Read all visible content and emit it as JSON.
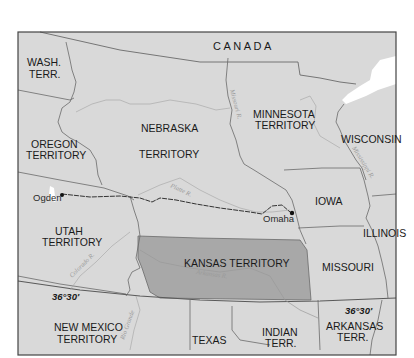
{
  "map": {
    "colors": {
      "land": "#d9d9d9",
      "kansas": "#a8a8a8",
      "lake": "#ffffff",
      "border": "#6a6a6a",
      "river": "#aaaaaa",
      "railroad": "#333333",
      "frame": "#444444"
    },
    "regions": {
      "canada": "CANADA",
      "wash_terr_1": "WASH.",
      "wash_terr_2": "TERR.",
      "oregon_1": "OREGON",
      "oregon_2": "TERRITORY",
      "nebraska_1": "NEBRASKA",
      "nebraska_2": "TERRITORY",
      "minnesota_1": "MINNESOTA",
      "minnesota_2": "TERRITORY",
      "wisconsin": "WISCONSIN",
      "iowa": "IOWA",
      "illinois": "ILLINOIS",
      "utah_1": "UTAH",
      "utah_2": "TERRITORY",
      "kansas": "KANSAS TERRITORY",
      "missouri": "MISSOURI",
      "new_mexico_1": "NEW MEXICO",
      "new_mexico_2": "TERRITORY",
      "texas": "TEXAS",
      "indian_1": "INDIAN",
      "indian_2": "TERR.",
      "arkansas_1": "ARKANSAS",
      "arkansas_2": "TERR."
    },
    "rivers": {
      "missouri": "Missouri R.",
      "mississippi": "Mississippi R.",
      "platte": "Platte R.",
      "arkansas": "Arkansas R.",
      "colorado": "Colorado R.",
      "rio_grande": "Rio Grande"
    },
    "cities": {
      "ogden": "Ogden",
      "omaha": "Omaha"
    },
    "parallels": {
      "left": "36°30'",
      "right": "36°30'"
    }
  }
}
